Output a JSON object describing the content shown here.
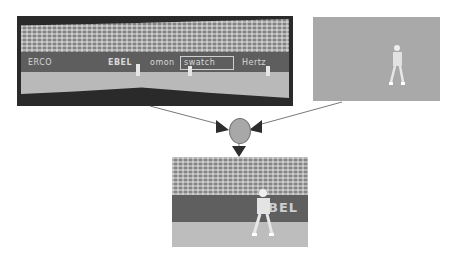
{
  "diagram": {
    "type": "video-compositing-flow",
    "nodes": [
      {
        "id": "background-panorama",
        "label": "",
        "description": "panoramic background mosaic of tennis stadium"
      },
      {
        "id": "foreground-player",
        "label": "",
        "description": "segmented tennis player on uniform gray background"
      },
      {
        "id": "combiner",
        "label": "",
        "shape": "circle"
      },
      {
        "id": "composited-frame",
        "label": "",
        "description": "reconstructed video frame with player over background"
      }
    ],
    "edges": [
      {
        "from": "background-panorama",
        "to": "combiner"
      },
      {
        "from": "foreground-player",
        "to": "combiner"
      },
      {
        "from": "combiner",
        "to": "composited-frame"
      }
    ]
  },
  "panorama": {
    "banners": [
      "ERCO",
      "EBEL",
      "omon",
      "swatch",
      "Hertz"
    ]
  },
  "output": {
    "banner": "BEL"
  },
  "colors": {
    "frame_dark": "#2a2a2a",
    "gray_bg": "#a9a9a9",
    "arrow": "#333333",
    "circle": "#a8a8a8"
  }
}
